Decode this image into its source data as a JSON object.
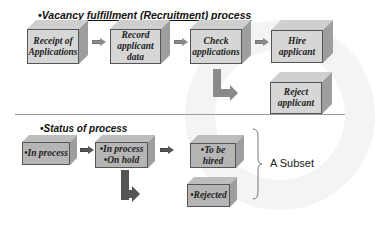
{
  "diagram": {
    "recruitment_title": "•Vacancy fulfillment (Recruitment) process",
    "status_title": "•Status of process",
    "recruitment_steps": [
      {
        "label": "Receipt of\nApplications"
      },
      {
        "label": "Record\napplicant\ndata"
      },
      {
        "label": "Check\napplications"
      },
      {
        "label": "Hire\napplicant"
      },
      {
        "label": "Reject\napplicant"
      }
    ],
    "status_steps": [
      {
        "label": "•In process"
      },
      {
        "label": "•In process\n•On hold"
      },
      {
        "label": "•To be\nhired"
      },
      {
        "label": "•Rejected"
      }
    ],
    "subset_label": "A Subset",
    "colors": {
      "box_front": "#d6d6d6",
      "box_side": "#9e9e9e",
      "arrow": "#8a8a8a",
      "arrow_dark": "#555555"
    }
  }
}
